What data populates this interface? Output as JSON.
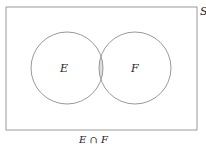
{
  "diagram": {
    "type": "venn",
    "sample_space_label": "S",
    "sets": [
      {
        "label": "E"
      },
      {
        "label": "F"
      }
    ],
    "shaded_region": "intersection",
    "caption": "E ∩ F",
    "colors": {
      "stroke": "#9a9a9a",
      "shade": "#dedede",
      "background": "#ffffff"
    }
  }
}
